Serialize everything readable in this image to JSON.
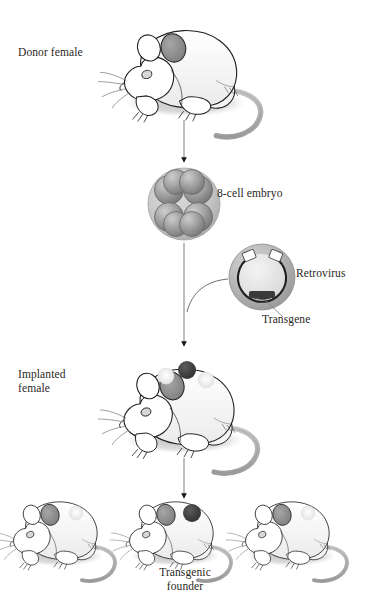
{
  "diagram": {
    "labels": {
      "donor_female": "Donor female",
      "embryo": "8-cell embryo",
      "retrovirus": "Retrovirus",
      "transgene": "Transgene",
      "implanted_female": "Implanted\nfemale",
      "transgenic_founder": "Transgenic\nfounder"
    },
    "steps": [
      {
        "id": "donor-female",
        "label": "Donor female",
        "kind": "mouse"
      },
      {
        "id": "embryo",
        "label": "8-cell embryo",
        "kind": "embryo",
        "cells": 8
      },
      {
        "id": "retrovirus",
        "label": "Retrovirus",
        "kind": "virus"
      },
      {
        "id": "implanted-female",
        "label": "Implanted female",
        "kind": "mouse",
        "spots": 3
      },
      {
        "id": "offspring",
        "label": "Transgenic founder",
        "kind": "mouse-litter",
        "count": 3,
        "transgenic_index": 1
      }
    ],
    "colors": {
      "background": "#ffffff",
      "outline": "#231f20",
      "text": "#2b2724",
      "shadow_gray": "#b9b9b9",
      "body_fill": "#ffffff",
      "ear_gray": "#8b8b8b",
      "embryo_zona": "#c9c9c9",
      "embryo_cell": "#9a9a9a",
      "virus_body": "#b5b5b5",
      "virus_core": "#e2e2e2",
      "transgene_dark": "#3a3a3a",
      "spot_dark": "#3d3d3d",
      "spot_light": "#ededed",
      "arrow_line": "#8a8a8a",
      "arrow_head": "#1a1a1a"
    }
  }
}
